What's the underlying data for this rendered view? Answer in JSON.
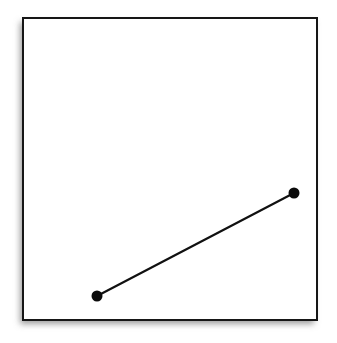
{
  "figure": {
    "title": "",
    "background_color": "#ffffff",
    "shadow": {
      "present": true,
      "sides": "left-and-bottom",
      "color": "#9a9a9a"
    }
  },
  "chart_data": {
    "type": "line",
    "title": "",
    "xlabel": "",
    "ylabel": "",
    "grid": true,
    "legend_position": "none",
    "grid_spec": {
      "columns": 6,
      "rows": 6,
      "x_lines": [
        0,
        1,
        2,
        3,
        4,
        5,
        6
      ],
      "y_lines": [
        0,
        1,
        2,
        3,
        4,
        5,
        6
      ],
      "xlim": [
        0,
        6
      ],
      "ylim": [
        0,
        6
      ],
      "cell_width_px": 49,
      "cell_height_px": 50,
      "frame_color": "#161616",
      "minor_line_color": "#2e2e2e",
      "fill_color": "#ffffff"
    },
    "series": [
      {
        "name": "segment",
        "color": "#111111",
        "line_width_px": 2.2,
        "marker": "filled-circle",
        "marker_radius_px": 5.5,
        "x": [
          1.5,
          5.53
        ],
        "y": [
          0.48,
          2.54
        ],
        "points_px": [
          {
            "x": 97,
            "y": 296
          },
          {
            "x": 294,
            "y": 193
          }
        ]
      }
    ],
    "annotations": []
  },
  "geometry_px": {
    "frame": {
      "x": 23,
      "y": 18,
      "width": 294,
      "height": 302
    },
    "vertical_lines_x": [
      23,
      72,
      121,
      170,
      219,
      268,
      317
    ],
    "horizontal_lines_y": [
      18,
      68,
      119,
      169,
      219,
      270,
      320
    ]
  }
}
